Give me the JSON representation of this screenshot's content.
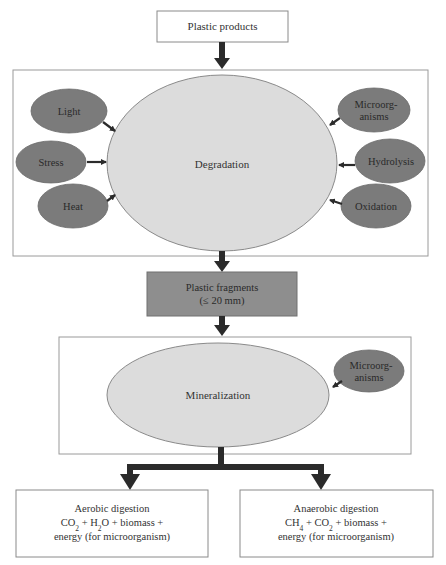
{
  "diagram": {
    "colors": {
      "box_border": "#8a8a8a",
      "frame_border": "#9a9a9a",
      "large_ellipse_fill": "#dcdcdc",
      "factor_ellipse_fill": "#7b7b7b",
      "fragments_fill": "#8e8e8e",
      "arrow": "#2b2b2b",
      "text": "#333333"
    },
    "nodes": {
      "plastic_products": {
        "label": "Plastic products"
      },
      "degradation": {
        "label": "Degradation"
      },
      "plastic_fragments": {
        "line1": "Plastic fragments",
        "line2": "(≤ 20 mm)"
      },
      "mineralization": {
        "label": "Mineralization"
      },
      "mineralization_microorganisms": {
        "line1": "Microorg-",
        "line2": "anisms"
      },
      "aerobic": {
        "title": "Aerobic digestion",
        "formula_parts": [
          {
            "text": "CO"
          },
          {
            "text": "2",
            "sub": true
          },
          {
            "text": " + H"
          },
          {
            "text": "2",
            "sub": true
          },
          {
            "text": "O + biomass +"
          }
        ],
        "line3": "energy (for microorganism)"
      },
      "anaerobic": {
        "title": "Anaerobic digestion",
        "formula_parts": [
          {
            "text": "CH"
          },
          {
            "text": "4",
            "sub": true
          },
          {
            "text": " + CO"
          },
          {
            "text": "2",
            "sub": true
          },
          {
            "text": " + biomass +"
          }
        ],
        "line3": "energy (for microorganism)"
      }
    },
    "degradation_factors": {
      "left": [
        {
          "label": "Light"
        },
        {
          "label": "Stress"
        },
        {
          "label": "Heat"
        }
      ],
      "right": [
        {
          "line1": "Microorg-",
          "line2": "anisms"
        },
        {
          "label": "Hydrolysis"
        },
        {
          "label": "Oxidation"
        }
      ]
    }
  }
}
